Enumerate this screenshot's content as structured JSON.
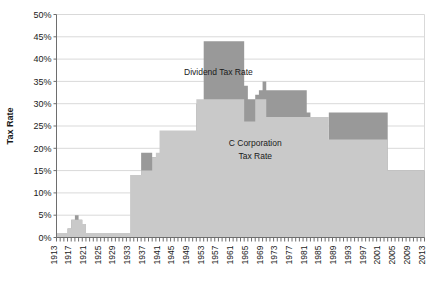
{
  "chart_data": {
    "type": "area",
    "title": "",
    "xlabel": "",
    "ylabel": "Tax Rate",
    "ylim": [
      0,
      50
    ],
    "xlim": [
      1913,
      2013
    ],
    "ytick_labels": [
      "0%",
      "5%",
      "10%",
      "15%",
      "20%",
      "25%",
      "30%",
      "35%",
      "40%",
      "45%",
      "50%"
    ],
    "ytick_values": [
      0,
      5,
      10,
      15,
      20,
      25,
      30,
      35,
      40,
      45,
      50
    ],
    "xtick_labels": [
      "1913",
      "1917",
      "1921",
      "1925",
      "1929",
      "1933",
      "1937",
      "1941",
      "1945",
      "1949",
      "1953",
      "1957",
      "1961",
      "1965",
      "1969",
      "1973",
      "1977",
      "1981",
      "1985",
      "1989",
      "1993",
      "1997",
      "2001",
      "2005",
      "2009",
      "2013"
    ],
    "xtick_values": [
      1913,
      1917,
      1921,
      1925,
      1929,
      1933,
      1937,
      1941,
      1945,
      1949,
      1953,
      1957,
      1961,
      1965,
      1969,
      1973,
      1977,
      1981,
      1985,
      1989,
      1993,
      1997,
      2001,
      2005,
      2009,
      2013
    ],
    "grid": true,
    "legend_position": "inline-annotation",
    "annotations": [
      {
        "text": "Dividend Tax Rate",
        "x": 1957,
        "y": 36.5
      },
      {
        "text": "C Corporation",
        "x": 1967,
        "y": 20.5
      },
      {
        "text": "Tax Rate",
        "x": 1967,
        "y": 17.6
      }
    ],
    "colors": {
      "dividend_tax_rate": "#999999",
      "c_corporation_tax_rate": "#c9c9c9",
      "grid": "#d9d9d9",
      "axis": "#6e6e6e",
      "text": "#1a1a1a"
    },
    "series": [
      {
        "name": "Dividend Tax Rate",
        "color": "#999999",
        "x": [
          1913,
          1914,
          1915,
          1916,
          1917,
          1918,
          1919,
          1920,
          1921,
          1922,
          1923,
          1924,
          1925,
          1926,
          1927,
          1928,
          1929,
          1930,
          1931,
          1932,
          1933,
          1934,
          1935,
          1936,
          1937,
          1938,
          1939,
          1940,
          1941,
          1942,
          1943,
          1944,
          1945,
          1946,
          1947,
          1948,
          1949,
          1950,
          1951,
          1952,
          1953,
          1954,
          1955,
          1956,
          1957,
          1958,
          1959,
          1960,
          1961,
          1962,
          1963,
          1964,
          1965,
          1966,
          1967,
          1968,
          1969,
          1970,
          1971,
          1972,
          1973,
          1974,
          1975,
          1976,
          1977,
          1978,
          1979,
          1980,
          1981,
          1982,
          1983,
          1984,
          1985,
          1986,
          1987,
          1988,
          1989,
          1990,
          1991,
          1992,
          1993,
          1994,
          1995,
          1996,
          1997,
          1998,
          1999,
          2000,
          2001,
          2002,
          2003,
          2004,
          2005,
          2006,
          2007,
          2008,
          2009,
          2010,
          2011,
          2012,
          2013
        ],
        "values": [
          1,
          1,
          1,
          2,
          4,
          5,
          4,
          3,
          1,
          1,
          1,
          1,
          1,
          1,
          1,
          1,
          1,
          1,
          1,
          1,
          1,
          1,
          1,
          19,
          19,
          19,
          18,
          18,
          18,
          18,
          18,
          18,
          18,
          18,
          18,
          18,
          18,
          18,
          30,
          30,
          44,
          44,
          44,
          44,
          44,
          44,
          44,
          44,
          44,
          44,
          44,
          34,
          31,
          31,
          32,
          33,
          35,
          33,
          33,
          33,
          33,
          33,
          33,
          33,
          33,
          33,
          33,
          33,
          28,
          20,
          20,
          20,
          20,
          20,
          28,
          28,
          28,
          28,
          28,
          28,
          28,
          28,
          28,
          28,
          28,
          28,
          28,
          28,
          28,
          28,
          15,
          15,
          15,
          15,
          15,
          15,
          15,
          15,
          15,
          15,
          15
        ]
      },
      {
        "name": "C Corporation Tax Rate",
        "color": "#c9c9c9",
        "x": [
          1913,
          1914,
          1915,
          1916,
          1917,
          1918,
          1919,
          1920,
          1921,
          1922,
          1923,
          1924,
          1925,
          1926,
          1927,
          1928,
          1929,
          1930,
          1931,
          1932,
          1933,
          1934,
          1935,
          1936,
          1937,
          1938,
          1939,
          1940,
          1941,
          1942,
          1943,
          1944,
          1945,
          1946,
          1947,
          1948,
          1949,
          1950,
          1951,
          1952,
          1953,
          1954,
          1955,
          1956,
          1957,
          1958,
          1959,
          1960,
          1961,
          1962,
          1963,
          1964,
          1965,
          1966,
          1967,
          1968,
          1969,
          1970,
          1971,
          1972,
          1973,
          1974,
          1975,
          1976,
          1977,
          1978,
          1979,
          1980,
          1981,
          1982,
          1983,
          1984,
          1985,
          1986,
          1987,
          1988,
          1989,
          1990,
          1991,
          1992,
          1993,
          1994,
          1995,
          1996,
          1997,
          1998,
          1999,
          2000,
          2001,
          2002,
          2003,
          2004,
          2005,
          2006,
          2007,
          2008,
          2009,
          2010,
          2011,
          2012,
          2013
        ],
        "values": [
          1,
          1,
          1,
          2,
          4,
          4,
          4,
          3,
          1,
          1,
          1,
          1,
          1,
          1,
          1,
          1,
          1,
          1,
          1,
          1,
          14,
          14,
          14,
          15,
          15,
          15,
          18,
          19,
          24,
          24,
          24,
          24,
          24,
          24,
          24,
          24,
          24,
          24,
          31,
          31,
          31,
          31,
          31,
          31,
          31,
          31,
          31,
          31,
          31,
          31,
          31,
          26,
          26,
          26,
          31,
          31,
          31,
          27,
          27,
          27,
          27,
          27,
          27,
          27,
          27,
          27,
          27,
          27,
          27,
          27,
          27,
          27,
          27,
          27,
          22,
          22,
          22,
          22,
          22,
          22,
          22,
          22,
          22,
          22,
          22,
          22,
          22,
          22,
          22,
          22,
          15,
          15,
          15,
          15,
          15,
          15,
          15,
          15,
          15,
          15,
          15
        ]
      }
    ]
  },
  "axis": {
    "ylabel": "Tax Rate"
  }
}
